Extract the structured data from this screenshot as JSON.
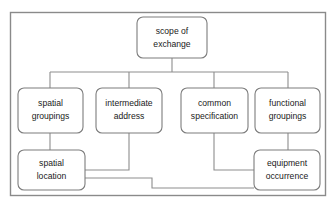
{
  "diagram": {
    "background_color": "#ffffff",
    "frame": {
      "name": "outer-frame",
      "stroke_color": "#8a8a8a"
    },
    "node_style": {
      "fill_color": "#ffffff",
      "stroke_color": "#7d7d7d",
      "text_color": "#1a1a1a"
    },
    "connector_color": "#8d8d8d",
    "nodes": [
      {
        "id": "scope-of-exchange",
        "lines": [
          "scope of",
          "exchange"
        ],
        "level": "root"
      },
      {
        "id": "spatial-groupings",
        "lines": [
          "spatial",
          "groupings"
        ],
        "level": "middle"
      },
      {
        "id": "intermediate-address",
        "lines": [
          "intermediate",
          "address"
        ],
        "level": "middle"
      },
      {
        "id": "common-specification",
        "lines": [
          "common",
          "specification"
        ],
        "level": "middle"
      },
      {
        "id": "functional-groupings",
        "lines": [
          "functional",
          "groupings"
        ],
        "level": "middle"
      },
      {
        "id": "spatial-location",
        "lines": [
          "spatial",
          "location"
        ],
        "level": "bottom"
      },
      {
        "id": "equipment-occurrence",
        "lines": [
          "equipment",
          "occurrence"
        ],
        "level": "bottom"
      }
    ],
    "edges": [
      {
        "id": "edge-scope-to-spatial-groupings",
        "from": "scope-of-exchange",
        "to": "spatial-groupings"
      },
      {
        "id": "edge-scope-to-intermediate-address",
        "from": "scope-of-exchange",
        "to": "intermediate-address"
      },
      {
        "id": "edge-scope-to-common-specification",
        "from": "scope-of-exchange",
        "to": "common-specification"
      },
      {
        "id": "edge-scope-to-functional-groupings",
        "from": "scope-of-exchange",
        "to": "functional-groupings"
      },
      {
        "id": "edge-spatial-groupings-to-spatial-location",
        "from": "spatial-groupings",
        "to": "spatial-location"
      },
      {
        "id": "edge-functional-groupings-to-equipment-occurrence",
        "from": "functional-groupings",
        "to": "equipment-occurrence"
      },
      {
        "id": "edge-intermediate-address-to-spatial-location",
        "from": "intermediate-address",
        "to": "spatial-location"
      },
      {
        "id": "edge-common-specification-to-equipment-occurrence",
        "from": "common-specification",
        "to": "equipment-occurrence"
      },
      {
        "id": "edge-spatial-location-to-equipment-occurrence",
        "from": "spatial-location",
        "to": "equipment-occurrence"
      }
    ]
  }
}
